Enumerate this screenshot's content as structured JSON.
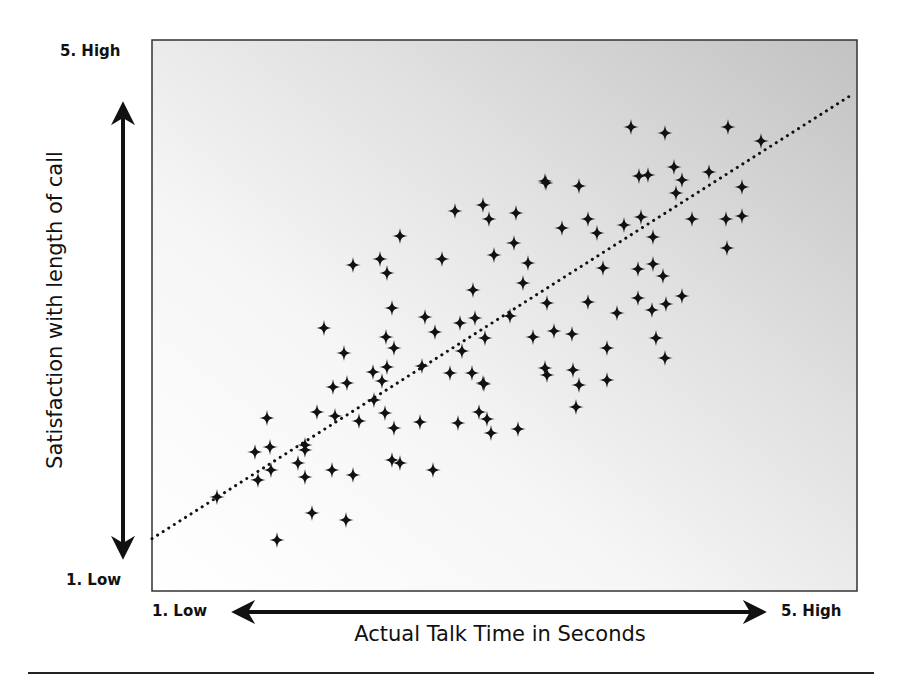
{
  "chart_data": {
    "type": "scatter",
    "title": "",
    "xlabel": "Actual Talk Time in Seconds",
    "ylabel": "Satisfaction with length of call",
    "x_tick_labels": [
      "1.  Low",
      "5.  High"
    ],
    "y_tick_labels": [
      "1.  Low",
      "5.  High"
    ],
    "xlim": [
      1,
      5
    ],
    "ylim": [
      1,
      5
    ],
    "grid": false,
    "legend": null,
    "marker": "four-point-star",
    "trendline": {
      "style": "dotted",
      "x": [
        1.0,
        4.98
      ],
      "y": [
        1.38,
        4.61
      ]
    },
    "series": [
      {
        "name": "calls",
        "points": [
          [
            1.37,
            1.83
          ],
          [
            1.49,
            1.99
          ],
          [
            1.6,
            1.34
          ],
          [
            1.6,
            2.17
          ],
          [
            1.67,
            2.27
          ],
          [
            1.67,
            2.44
          ],
          [
            1.67,
            2.6
          ],
          [
            1.6,
            2.93
          ],
          [
            1.83,
            2.02
          ],
          [
            1.85,
            2.23
          ],
          [
            1.85,
            2.32
          ],
          [
            1.85,
            2.37
          ],
          [
            1.81,
            2.37
          ],
          [
            2.15,
            2.07
          ],
          [
            2.16,
            2.25
          ],
          [
            2.14,
            2.29
          ],
          [
            2.27,
            2.85
          ],
          [
            2.34,
            2.77
          ],
          [
            2.34,
            2.99
          ],
          [
            2.46,
            3.08
          ],
          [
            2.5,
            3.02
          ],
          [
            2.47,
            2.63
          ],
          [
            2.13,
            3.25
          ],
          [
            2.21,
            2.79
          ],
          [
            2.39,
            2.73
          ],
          [
            2.46,
            3.21
          ],
          [
            2.51,
            3.29
          ],
          [
            2.63,
            3.08
          ],
          [
            2.72,
            3.21
          ],
          [
            2.46,
            2.44
          ],
          [
            2.51,
            2.42
          ],
          [
            2.6,
            2.56
          ],
          [
            2.6,
            2.67
          ],
          [
            2.79,
            2.37
          ],
          [
            2.82,
            2.2
          ],
          [
            2.56,
            4.0
          ],
          [
            2.74,
            3.88
          ],
          [
            2.79,
            3.79
          ],
          [
            2.85,
            3.69
          ],
          [
            2.86,
            4.22
          ],
          [
            3.06,
            3.87
          ],
          [
            3.02,
            3.33
          ],
          [
            3.0,
            3.0
          ],
          [
            2.94,
            3.19
          ],
          [
            3.07,
            3.03
          ],
          [
            2.91,
            3.06
          ],
          [
            2.9,
            3.27
          ],
          [
            2.99,
            2.81
          ],
          [
            3.01,
            2.55
          ],
          [
            3.03,
            2.62
          ],
          [
            3.05,
            2.52
          ],
          [
            3.2,
            2.55
          ],
          [
            3.16,
            4.47
          ],
          [
            3.21,
            4.37
          ],
          [
            3.23,
            4.61
          ],
          [
            3.36,
            4.51
          ],
          [
            3.34,
            4.26
          ],
          [
            3.23,
            4.17
          ],
          [
            3.22,
            3.9
          ],
          [
            3.33,
            3.82
          ],
          [
            3.38,
            3.71
          ],
          [
            3.38,
            3.35
          ],
          [
            3.36,
            3.1
          ],
          [
            3.44,
            3.09
          ],
          [
            3.35,
            3.15
          ],
          [
            3.5,
            3.12
          ],
          [
            3.57,
            3.37
          ],
          [
            3.69,
            2.95
          ],
          [
            3.55,
            2.82
          ],
          [
            3.56,
            2.86
          ],
          [
            3.6,
            2.75
          ],
          [
            3.67,
            2.46
          ],
          [
            3.49,
            4.27
          ],
          [
            3.67,
            4.77
          ],
          [
            3.75,
            4.67
          ],
          [
            3.63,
            4.81
          ],
          [
            3.84,
            4.42
          ],
          [
            3.83,
            4.21
          ],
          [
            3.75,
            4.41
          ],
          [
            3.75,
            3.8
          ],
          [
            3.8,
            3.87
          ],
          [
            3.87,
            3.95
          ],
          [
            3.98,
            3.69
          ],
          [
            3.95,
            3.46
          ],
          [
            3.8,
            3.53
          ],
          [
            3.94,
            3.32
          ],
          [
            3.92,
            3.14
          ],
          [
            4.14,
            4.57
          ],
          [
            4.18,
            4.49
          ],
          [
            4.31,
            4.4
          ],
          [
            4.39,
            4.19
          ],
          [
            4.38,
            3.63
          ],
          [
            4.27,
            3.99
          ],
          [
            4.31,
            3.72
          ],
          [
            4.31,
            3.6
          ],
          [
            4.42,
            3.43
          ],
          [
            4.42,
            3.79
          ],
          [
            4.49,
            4.0
          ],
          [
            4.48,
            5.31
          ],
          [
            4.67,
            5.27
          ],
          [
            4.58,
            4.84
          ],
          [
            4.62,
            4.98
          ],
          [
            4.68,
            5.08
          ],
          [
            4.78,
            4.99
          ],
          [
            4.91,
            4.74
          ],
          [
            4.91,
            4.6
          ],
          [
            4.96,
            4.64
          ],
          [
            4.64,
            5.32
          ],
          [
            4.53,
            4.51
          ],
          [
            4.67,
            4.26
          ],
          [
            4.76,
            4.34
          ],
          [
            4.38,
            3.99
          ],
          [
            4.59,
            4.14
          ],
          [
            4.54,
            4.06
          ],
          [
            4.51,
            4.36
          ],
          [
            4.51,
            3.58
          ],
          [
            4.44,
            3.97
          ],
          [
            4.47,
            3.55
          ],
          [
            4.31,
            4.08
          ],
          [
            4.62,
            4.07
          ],
          [
            4.63,
            4.22
          ],
          [
            4.83,
            4.56
          ],
          [
            4.81,
            5.14
          ],
          [
            4.6,
            4.4
          ],
          [
            4.45,
            4.56
          ],
          [
            4.71,
            4.4
          ],
          [
            4.57,
            4.1
          ],
          [
            4.59,
            4.15
          ]
        ]
      }
    ]
  },
  "labels": {
    "y_high": "5.  High",
    "y_low": "1.  Low",
    "x_low": "1.  Low",
    "x_high": "5.  High",
    "x_title": "Actual Talk Time in Seconds",
    "y_title": "Satisfaction with length of call"
  },
  "pixel_points": [
    [
      217,
      497
    ],
    [
      255,
      452
    ],
    [
      270,
      447
    ],
    [
      267,
      418
    ],
    [
      258,
      480
    ],
    [
      271,
      470
    ],
    [
      277,
      540
    ],
    [
      305,
      445
    ],
    [
      305,
      450
    ],
    [
      298,
      463
    ],
    [
      305,
      477
    ],
    [
      312,
      513
    ],
    [
      346,
      520
    ],
    [
      317,
      412
    ],
    [
      335,
      416
    ],
    [
      359,
      421
    ],
    [
      333,
      387
    ],
    [
      347,
      383
    ],
    [
      332,
      470
    ],
    [
      353,
      475
    ],
    [
      324,
      328
    ],
    [
      344,
      353
    ],
    [
      353,
      265
    ],
    [
      380,
      259
    ],
    [
      387,
      273
    ],
    [
      400,
      236
    ],
    [
      392,
      308
    ],
    [
      386,
      337
    ],
    [
      394,
      348
    ],
    [
      373,
      372
    ],
    [
      387,
      367
    ],
    [
      382,
      381
    ],
    [
      374,
      400
    ],
    [
      385,
      413
    ],
    [
      394,
      428
    ],
    [
      392,
      460
    ],
    [
      400,
      463
    ],
    [
      433,
      470
    ],
    [
      420,
      422
    ],
    [
      458,
      423
    ],
    [
      422,
      366
    ],
    [
      425,
      317
    ],
    [
      435,
      332
    ],
    [
      442,
      259
    ],
    [
      455,
      211
    ],
    [
      483,
      205
    ],
    [
      489,
      219
    ],
    [
      516,
      213
    ],
    [
      514,
      243
    ],
    [
      494,
      255
    ],
    [
      528,
      263
    ],
    [
      523,
      283
    ],
    [
      473,
      290
    ],
    [
      460,
      323
    ],
    [
      475,
      318
    ],
    [
      462,
      351
    ],
    [
      450,
      373
    ],
    [
      472,
      373
    ],
    [
      483,
      383
    ],
    [
      484,
      384
    ],
    [
      479,
      412
    ],
    [
      487,
      419
    ],
    [
      491,
      433
    ],
    [
      518,
      429
    ],
    [
      510,
      316
    ],
    [
      485,
      338
    ],
    [
      533,
      337
    ],
    [
      547,
      303
    ],
    [
      546,
      183
    ],
    [
      545,
      181
    ],
    [
      579,
      186
    ],
    [
      588,
      219
    ],
    [
      562,
      228
    ],
    [
      597,
      233
    ],
    [
      624,
      225
    ],
    [
      603,
      268
    ],
    [
      588,
      302
    ],
    [
      573,
      370
    ],
    [
      547,
      375
    ],
    [
      545,
      368
    ],
    [
      554,
      331
    ],
    [
      572,
      334
    ],
    [
      579,
      385
    ],
    [
      576,
      407
    ],
    [
      607,
      348
    ],
    [
      607,
      380
    ],
    [
      617,
      313
    ],
    [
      631,
      127
    ],
    [
      665,
      133
    ],
    [
      639,
      176
    ],
    [
      648,
      175
    ],
    [
      674,
      167
    ],
    [
      682,
      180
    ],
    [
      676,
      193
    ],
    [
      709,
      172
    ],
    [
      742,
      187
    ],
    [
      726,
      219
    ],
    [
      742,
      216
    ],
    [
      727,
      248
    ],
    [
      761,
      141
    ],
    [
      728,
      127
    ],
    [
      641,
      217
    ],
    [
      653,
      237
    ],
    [
      692,
      219
    ],
    [
      638,
      269
    ],
    [
      653,
      264
    ],
    [
      663,
      276
    ],
    [
      638,
      298
    ],
    [
      682,
      296
    ],
    [
      666,
      304
    ],
    [
      652,
      310
    ],
    [
      656,
      338
    ],
    [
      665,
      358
    ]
  ],
  "colors": {
    "marker": "#111111",
    "trendline": "#111111",
    "plot_bg_light": "#ffffff",
    "plot_bg_dark": "#c4c4c4",
    "frame": "#333333"
  }
}
